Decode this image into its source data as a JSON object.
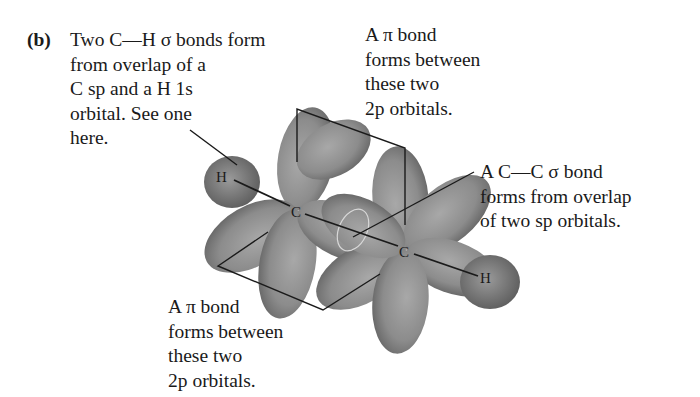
{
  "figure": {
    "panel_label": "(b)",
    "atoms": {
      "h_left": "H",
      "c_left": "C",
      "c_right": "C",
      "h_right": "H"
    },
    "colors": {
      "orbital": "#8a8a8a",
      "orbital_dark": "#5e5e5e",
      "line": "#1a1a1a",
      "text": "#1a1a1a"
    }
  },
  "annotations": {
    "ch_sigma": {
      "lines": [
        "Two C—H σ bonds form",
        "from overlap of a",
        "C sp and a H 1s",
        "orbital. See one",
        "here."
      ]
    },
    "pi_top": {
      "lines": [
        "A π bond",
        "forms between",
        "these two",
        "2p orbitals."
      ]
    },
    "cc_sigma": {
      "lines": [
        "A C—C σ bond",
        "forms from overlap",
        "of two sp orbitals."
      ]
    },
    "pi_bottom": {
      "lines": [
        "A π bond",
        "forms between",
        "these two",
        "2p orbitals."
      ]
    }
  }
}
